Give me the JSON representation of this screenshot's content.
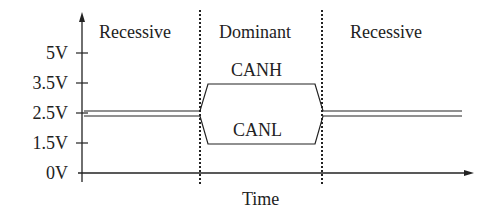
{
  "diagram": {
    "regions": [
      {
        "label": "Recessive"
      },
      {
        "label": "Dominant"
      },
      {
        "label": "Recessive"
      }
    ],
    "signals": {
      "high": "CANH",
      "low": "CANL"
    },
    "y_axis": {
      "ticks": [
        "5V",
        "3.5V",
        "2.5V",
        "1.5V",
        "0V"
      ]
    },
    "x_axis": {
      "label": "Time"
    },
    "levels": {
      "CANH_dominant": "3.5V",
      "CANL_dominant": "1.5V",
      "recessive": "2.5V"
    },
    "colors": {
      "line": "#222222",
      "background": "#ffffff"
    }
  }
}
